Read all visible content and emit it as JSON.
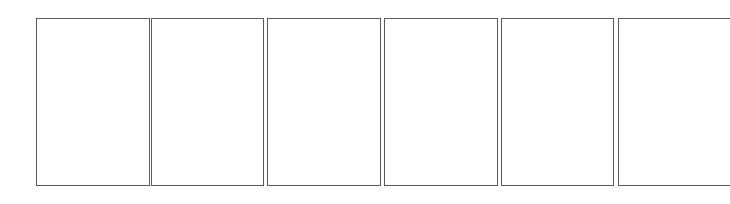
{
  "panels": [
    {
      "index": 1,
      "left": 36,
      "width": 114
    },
    {
      "index": 2,
      "left": 151,
      "width": 113
    },
    {
      "index": 3,
      "left": 267,
      "width": 114
    },
    {
      "index": 4,
      "left": 384,
      "width": 114
    },
    {
      "index": 5,
      "left": 501,
      "width": 113
    },
    {
      "index": 6,
      "left": 618,
      "width": 112
    }
  ],
  "colors": {
    "background": "#ffffff",
    "panel_border": "#5a5a5a"
  }
}
